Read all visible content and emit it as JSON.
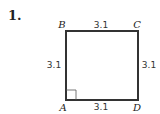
{
  "problem": {
    "number": "1."
  },
  "figure": {
    "shape": "square",
    "vertices": {
      "top_left": "B",
      "top_right": "C",
      "bottom_left": "A",
      "bottom_right": "D"
    },
    "side_lengths": {
      "top": "3.1",
      "right": "3.1",
      "bottom": "3.1",
      "left": "3.1"
    },
    "right_angle_at": "A",
    "stroke_color": "#333333"
  }
}
